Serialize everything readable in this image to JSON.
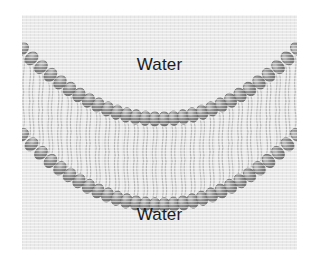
{
  "figure": {
    "background_color": "#ffffff",
    "panel_color": "#e9e9e9"
  },
  "labels": {
    "water_top": "Water",
    "water_bottom": "Water",
    "text_color": "#1d1d1d"
  },
  "membrane": {
    "name": "phospholipid-bilayer",
    "head_group_color": "#8f8f8f",
    "head_group_highlight": "#bcbcbc",
    "head_group_outline": "#6d6d6d",
    "tail_color": "#b8b8b8",
    "leaflets": [
      {
        "name": "outer-leaflet",
        "head_count": 30,
        "tail_direction": "down"
      },
      {
        "name": "inner-leaflet",
        "head_count": 30,
        "tail_direction": "up"
      }
    ],
    "curve": {
      "shape": "parabolic-concave-up",
      "outer_head_y_left": 34,
      "outer_head_y_center": 104,
      "outer_head_y_right": 34,
      "inner_head_y_left": 120,
      "inner_head_y_center": 190,
      "inner_head_y_right": 120
    }
  }
}
